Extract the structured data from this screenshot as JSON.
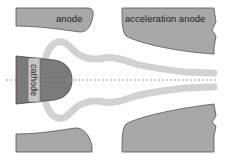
{
  "diagram": {
    "labels": {
      "anode": "anode",
      "acceleration_anode": "acceleration anode",
      "cathode": "cathode"
    },
    "components": [
      {
        "name": "anode",
        "position": "top-left and bottom-left plates"
      },
      {
        "name": "acceleration anode",
        "position": "top-right and bottom-right plates"
      },
      {
        "name": "cathode",
        "position": "left center, on axis"
      },
      {
        "name": "electron beam",
        "position": "from cathode converging toward axis at right"
      },
      {
        "name": "optical axis",
        "style": "dashed horizontal line"
      }
    ],
    "colors": {
      "electrode_fill": "#a8a8a8",
      "electrode_stroke": "#555555",
      "cathode_fill": "#7a7a7a",
      "cathode_band": "#c4c4c4",
      "beam": "#d2d2d2",
      "axis": "#9a9a9a",
      "background": "#ffffff"
    }
  }
}
